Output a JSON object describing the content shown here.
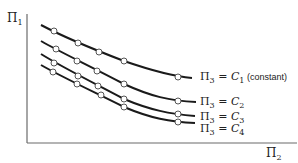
{
  "diagram": {
    "y_axis_label": "Π",
    "y_axis_sub": "1",
    "x_axis_label": "Π",
    "x_axis_sub": "2",
    "axis_color": "#6b6b6b",
    "curve_color": "#1a1a1a",
    "curves": [
      {
        "name": "c1",
        "label_pi": "Π",
        "label_pi_sub": "3",
        "label_eq": "=",
        "label_c": "C",
        "label_c_sub": "1",
        "label_note": "(constant)",
        "path": "M41,25 C60,35 90,48 124,61 C150,70 170,76 192,78",
        "markers": [
          [
            54,
            31
          ],
          [
            78,
            43
          ],
          [
            99,
            52
          ],
          [
            124,
            61
          ],
          [
            178,
            77
          ]
        ],
        "label_pos": [
          200,
          80
        ]
      },
      {
        "name": "c2",
        "label_pi": "Π",
        "label_pi_sub": "3",
        "label_eq": "=",
        "label_c": "C",
        "label_c_sub": "2",
        "label_note": "",
        "path": "M41,41 C60,52 90,66 124,84 C150,96 170,101 196,102",
        "markers": [
          [
            56,
            49
          ],
          [
            77,
            61
          ],
          [
            97,
            71
          ],
          [
            124,
            84
          ],
          [
            178,
            101
          ]
        ],
        "label_pos": [
          200,
          105
        ]
      },
      {
        "name": "c3",
        "label_pi": "Π",
        "label_pi_sub": "3",
        "label_eq": "=",
        "label_c": "C",
        "label_c_sub": "3",
        "label_note": "",
        "path": "M41,54 C60,66 90,81 124,99 C150,110 170,114 195,116",
        "markers": [
          [
            54,
            63
          ],
          [
            78,
            76
          ],
          [
            98,
            86
          ],
          [
            124,
            99
          ],
          [
            178,
            114
          ]
        ],
        "label_pos": [
          200,
          120
        ]
      },
      {
        "name": "c4",
        "label_pi": "Π",
        "label_pi_sub": "3",
        "label_eq": "=",
        "label_c": "C",
        "label_c_sub": "4",
        "label_note": "",
        "path": "M41,65 C60,76 90,90 124,107 C150,118 170,122 195,123",
        "markers": [
          [
            53,
            72
          ],
          [
            77,
            84
          ],
          [
            101,
            95
          ],
          [
            124,
            107
          ],
          [
            178,
            122
          ]
        ],
        "label_pos": [
          200,
          132
        ]
      }
    ]
  }
}
